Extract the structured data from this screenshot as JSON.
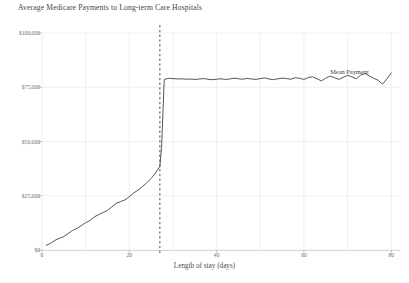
{
  "chart_data": {
    "type": "line",
    "title": "Average Medicare Payments to Long-term Care Hospitals",
    "xlabel": "Length of stay (days)",
    "ylabel": "",
    "xlim": [
      0,
      82
    ],
    "ylim": [
      0,
      100000
    ],
    "grid": true,
    "legend_position": "inline-annotation",
    "xticks": [
      0,
      20,
      40,
      60,
      80
    ],
    "xtick_labels": [
      "0",
      "20",
      "40",
      "60",
      "80"
    ],
    "yticks": [
      0,
      25000,
      50000,
      75000,
      100000
    ],
    "ytick_labels": [
      "$0",
      "$25,000",
      "$50,000",
      "$75,000",
      "$100,000"
    ],
    "annotations": [
      {
        "text": "Mean Payment",
        "x": 66,
        "y": 84000
      }
    ],
    "reference_lines": [
      {
        "name": "short-stay-outlier-threshold",
        "orientation": "vertical",
        "x": 27,
        "style": "dashed"
      }
    ],
    "series": [
      {
        "name": "Mean Payment",
        "color": "#4d4d4d",
        "x": [
          1,
          2,
          3,
          4,
          5,
          6,
          7,
          8,
          9,
          10,
          11,
          12,
          13,
          14,
          15,
          16,
          17,
          18,
          19,
          20,
          21,
          22,
          23,
          24,
          25,
          26,
          27,
          27.4,
          28,
          29,
          30,
          31,
          32,
          33,
          34,
          35,
          36,
          37,
          38,
          39,
          40,
          41,
          42,
          43,
          44,
          45,
          46,
          47,
          48,
          49,
          50,
          51,
          52,
          53,
          54,
          55,
          56,
          57,
          58,
          59,
          60,
          61,
          62,
          63,
          64,
          65,
          66,
          67,
          68,
          69,
          70,
          71,
          72,
          73,
          74,
          75,
          76,
          77,
          78,
          79,
          80
        ],
        "values": [
          2200,
          3100,
          4500,
          5400,
          6200,
          7600,
          9000,
          9900,
          11200,
          12600,
          13600,
          15300,
          16300,
          17300,
          18200,
          19900,
          21500,
          22300,
          23100,
          24600,
          26300,
          27600,
          29200,
          31000,
          33000,
          35500,
          38500,
          47800,
          78600,
          79100,
          79000,
          78800,
          78900,
          78700,
          78800,
          78600,
          78800,
          79000,
          78700,
          78500,
          78700,
          78900,
          78600,
          78800,
          79200,
          78900,
          78700,
          79100,
          78800,
          78600,
          79000,
          79300,
          78800,
          78500,
          78900,
          79200,
          79000,
          78700,
          79400,
          79100,
          78600,
          79500,
          79800,
          78900,
          77900,
          79200,
          80100,
          79400,
          78600,
          79600,
          80500,
          79800,
          78900,
          80600,
          81300,
          80200,
          79100,
          78200,
          76400,
          78900,
          81600
        ]
      }
    ]
  }
}
